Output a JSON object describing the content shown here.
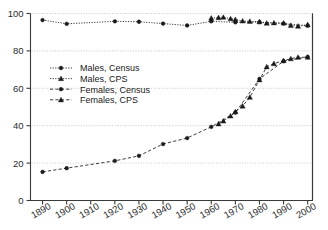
{
  "chart_data": {
    "type": "line",
    "title": "",
    "subtitle": "",
    "xlabel": "",
    "ylabel": "",
    "xlim": [
      1885,
      2002
    ],
    "ylim": [
      0,
      100
    ],
    "grid": true,
    "grid_values": [
      20,
      40,
      60,
      80,
      100
    ],
    "legend_position": "inside-upper-left",
    "y_ticks": [
      "0",
      "20",
      "40",
      "60",
      "80",
      "100"
    ],
    "y_tick_values": [
      0,
      20,
      40,
      60,
      80,
      100
    ],
    "x_ticks": [
      "1890",
      "1900",
      "1910",
      "1920",
      "1930",
      "1940",
      "1950",
      "1960",
      "1970",
      "1980",
      "1990",
      "2000"
    ],
    "x_tick_values": [
      1890,
      1900,
      1910,
      1920,
      1930,
      1940,
      1950,
      1960,
      1970,
      1980,
      1990,
      2000
    ],
    "series": [
      {
        "name": "Males, Census",
        "marker": "circle",
        "line": "dotted",
        "color": "#1a1a1a",
        "x": [
          1890,
          1900,
          1920,
          1930,
          1940,
          1950,
          1960,
          1970,
          1980,
          1990,
          2000
        ],
        "values": [
          96.5,
          94.5,
          95.8,
          95.6,
          94.6,
          93.6,
          95.8,
          95.3,
          95.4,
          94.6,
          93.5
        ]
      },
      {
        "name": "Males, CPS",
        "marker": "triangle",
        "line": "dotted",
        "color": "#1a1a1a",
        "x": [
          1960,
          1963,
          1965,
          1968,
          1970,
          1973,
          1976,
          1980,
          1983,
          1986,
          1990,
          1993,
          1996,
          2000
        ],
        "values": [
          97.5,
          97.8,
          98.0,
          97.2,
          96.8,
          96.0,
          95.8,
          95.6,
          94.8,
          95.0,
          94.9,
          93.6,
          93.2,
          94.0
        ]
      },
      {
        "name": "Females, Census",
        "marker": "circle",
        "line": "dashed",
        "color": "#1a1a1a",
        "x": [
          1890,
          1900,
          1920,
          1930,
          1940,
          1950,
          1960,
          1970,
          1980,
          1990,
          2000
        ],
        "values": [
          15.3,
          17.3,
          21.2,
          23.9,
          30.2,
          33.4,
          39.4,
          47.0,
          65.0,
          74.5,
          76.8
        ]
      },
      {
        "name": "Females, CPS",
        "marker": "triangle",
        "line": "dashed",
        "color": "#1a1a1a",
        "x": [
          1963,
          1965,
          1968,
          1970,
          1973,
          1976,
          1980,
          1983,
          1986,
          1990,
          1993,
          1996,
          2000
        ],
        "values": [
          41.0,
          42.5,
          45.2,
          47.5,
          50.5,
          55.2,
          64.5,
          71.5,
          73.2,
          74.8,
          75.8,
          76.6,
          76.6
        ]
      }
    ]
  },
  "legend": {
    "items": [
      {
        "label": "Males, Census",
        "marker": "circle",
        "line": "dotted"
      },
      {
        "label": "Males, CPS",
        "marker": "triangle",
        "line": "dotted"
      },
      {
        "label": "Females, Census",
        "marker": "circle",
        "line": "dashed"
      },
      {
        "label": "Females, CPS",
        "marker": "triangle",
        "line": "dashed"
      }
    ]
  },
  "colors": {
    "ink": "#1a1a1a",
    "axis": "#3a3a3a",
    "grid": "#b9b9b9",
    "background": "#ffffff"
  }
}
